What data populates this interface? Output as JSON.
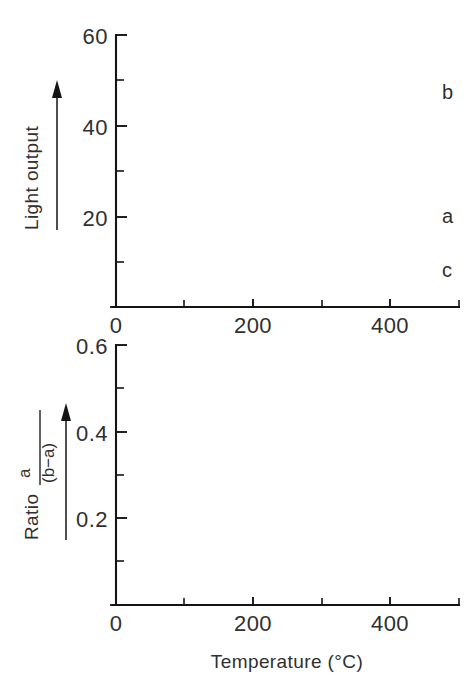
{
  "figure": {
    "background": "#ffffff",
    "ink_color": "#1a1a1a"
  },
  "chart_data": [
    {
      "id": "top-panel",
      "type": "line",
      "title": "",
      "xlabel": "",
      "ylabel": "Light output",
      "xlim": [
        0,
        500
      ],
      "ylim": [
        0,
        60
      ],
      "xticks": [
        0,
        200,
        400
      ],
      "xtick_labels": [
        "0",
        "200",
        "400"
      ],
      "xticks_minor": [
        100,
        300
      ],
      "yticks": [
        0,
        20,
        40,
        60
      ],
      "ytick_labels": [
        "0",
        "20",
        "40",
        "60"
      ],
      "yticks_minor": [
        10,
        30,
        50
      ],
      "grid": false,
      "legend": "inline-curve-labels",
      "series": [
        {
          "name": "b",
          "label": "b",
          "style": "solid",
          "points": [
            [
              30,
              0.3
            ],
            [
              45,
              0.6
            ],
            [
              55,
              1.2
            ],
            [
              65,
              2.4
            ],
            [
              75,
              5.0
            ],
            [
              85,
              9.5
            ],
            [
              95,
              16.0
            ],
            [
              103,
              22.0
            ],
            [
              110,
              28.0
            ],
            [
              116,
              32.5
            ],
            [
              122,
              36.4
            ],
            [
              127,
              38.2
            ],
            [
              132,
              38.0
            ],
            [
              138,
              35.5
            ],
            [
              144,
              32.0
            ],
            [
              151,
              29.0
            ],
            [
              158,
              27.0
            ],
            [
              166,
              25.8
            ],
            [
              174,
              25.3
            ],
            [
              182,
              25.6
            ],
            [
              190,
              26.3
            ],
            [
              198,
              27.0
            ],
            [
              206,
              27.3
            ],
            [
              214,
              27.2
            ],
            [
              222,
              27.6
            ],
            [
              232,
              28.8
            ],
            [
              242,
              30.5
            ],
            [
              252,
              32.4
            ],
            [
              262,
              34.4
            ],
            [
              272,
              36.4
            ],
            [
              282,
              38.3
            ],
            [
              292,
              39.6
            ],
            [
              302,
              40.4
            ],
            [
              312,
              40.7
            ],
            [
              322,
              40.9
            ],
            [
              332,
              41.4
            ],
            [
              342,
              42.4
            ],
            [
              352,
              43.8
            ],
            [
              362,
              45.4
            ],
            [
              372,
              47.0
            ],
            [
              382,
              48.6
            ],
            [
              392,
              50.0
            ],
            [
              402,
              50.9
            ],
            [
              412,
              51.2
            ],
            [
              422,
              50.7
            ],
            [
              432,
              49.2
            ],
            [
              442,
              47.2
            ],
            [
              452,
              45.5
            ],
            [
              462,
              44.5
            ],
            [
              472,
              44.1
            ],
            [
              482,
              44.0
            ],
            [
              492,
              44.0
            ],
            [
              500,
              44.0
            ]
          ]
        },
        {
          "name": "a",
          "label": "a",
          "style": "solid",
          "points": [
            [
              150,
              0.1
            ],
            [
              170,
              0.2
            ],
            [
              185,
              0.4
            ],
            [
              195,
              0.8
            ],
            [
              205,
              1.6
            ],
            [
              215,
              2.8
            ],
            [
              225,
              4.4
            ],
            [
              235,
              6.2
            ],
            [
              245,
              8.2
            ],
            [
              255,
              10.1
            ],
            [
              265,
              11.7
            ],
            [
              275,
              12.8
            ],
            [
              285,
              13.5
            ],
            [
              295,
              13.9
            ],
            [
              305,
              14.2
            ],
            [
              315,
              14.6
            ],
            [
              325,
              15.1
            ],
            [
              335,
              15.6
            ],
            [
              345,
              16.1
            ],
            [
              355,
              16.6
            ],
            [
              365,
              17.1
            ],
            [
              375,
              17.6
            ],
            [
              385,
              18.0
            ],
            [
              395,
              18.3
            ],
            [
              405,
              18.3
            ],
            [
              415,
              18.0
            ],
            [
              425,
              17.6
            ],
            [
              435,
              17.4
            ],
            [
              445,
              17.5
            ],
            [
              455,
              17.9
            ],
            [
              465,
              18.5
            ],
            [
              475,
              19.3
            ],
            [
              485,
              20.1
            ],
            [
              495,
              20.9
            ],
            [
              500,
              21.3
            ]
          ]
        },
        {
          "name": "c",
          "label": "c",
          "style": "solid",
          "points": [
            [
              400,
              0.1
            ],
            [
              415,
              0.4
            ],
            [
              425,
              0.8
            ],
            [
              435,
              1.4
            ],
            [
              445,
              2.2
            ],
            [
              455,
              3.1
            ],
            [
              465,
              4.0
            ],
            [
              475,
              4.9
            ],
            [
              485,
              5.7
            ],
            [
              495,
              6.5
            ],
            [
              500,
              6.9
            ]
          ]
        }
      ]
    },
    {
      "id": "bottom-panel",
      "type": "scatter",
      "title": "",
      "xlabel": "Temperature (°C)",
      "ylabel": "Ratio a/(b−a)",
      "ylabel_parts": {
        "prefix": "Ratio",
        "numerator": "a",
        "denominator": "(b−a)"
      },
      "xlim": [
        0,
        500
      ],
      "ylim": [
        0,
        0.6
      ],
      "xticks": [
        0,
        200,
        400
      ],
      "xtick_labels": [
        "0",
        "200",
        "400"
      ],
      "xticks_minor": [
        100,
        300
      ],
      "yticks": [
        0,
        0.2,
        0.4,
        0.6
      ],
      "ytick_labels": [
        "0",
        "0.2",
        "0.4",
        "0.6"
      ],
      "yticks_minor": [
        0.1,
        0.3,
        0.5
      ],
      "grid": false,
      "fit_style": "dashed",
      "series": [
        {
          "name": "ratio",
          "label": "",
          "style": "dashed-with-markers",
          "points": [
            [
              197,
              0.05
            ],
            [
              212,
              0.14
            ],
            [
              222,
              0.2
            ],
            [
              237,
              0.31
            ],
            [
              245,
              0.365
            ],
            [
              258,
              0.45
            ],
            [
              267,
              0.49
            ],
            [
              280,
              0.54
            ],
            [
              293,
              0.562
            ],
            [
              305,
              0.57
            ],
            [
              320,
              0.572
            ],
            [
              335,
              0.573
            ],
            [
              350,
              0.57
            ],
            [
              367,
              0.57
            ],
            [
              382,
              0.568
            ],
            [
              397,
              0.566
            ],
            [
              412,
              0.565
            ],
            [
              428,
              0.568
            ],
            [
              445,
              0.57
            ],
            [
              462,
              0.572
            ],
            [
              480,
              0.575
            ],
            [
              495,
              0.577
            ]
          ],
          "marker_points": [
            [
              197,
              0.05
            ],
            [
              222,
              0.2
            ],
            [
              245,
              0.365
            ],
            [
              267,
              0.49
            ],
            [
              287,
              0.552
            ],
            [
              305,
              0.57
            ],
            [
              325,
              0.572
            ],
            [
              345,
              0.57
            ],
            [
              365,
              0.57
            ],
            [
              385,
              0.568
            ],
            [
              405,
              0.566
            ],
            [
              425,
              0.567
            ],
            [
              447,
              0.57
            ],
            [
              470,
              0.573
            ],
            [
              492,
              0.577
            ]
          ]
        }
      ]
    }
  ]
}
